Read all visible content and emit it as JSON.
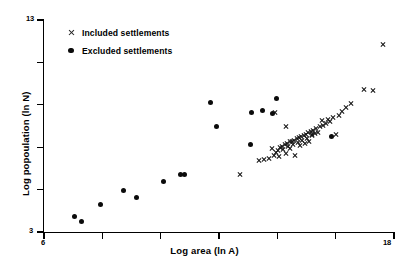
{
  "chart_data": {
    "type": "scatter",
    "title": "",
    "xlabel": "Log area (ln A)",
    "ylabel": "Log popoulation (ln N)",
    "xlim": [
      6,
      18
    ],
    "ylim": [
      3,
      13
    ],
    "xticks": [
      6,
      8,
      10,
      12,
      14,
      16,
      18
    ],
    "yticks": [
      3,
      5,
      7,
      9,
      11,
      13
    ],
    "xtick_labels": [
      "6",
      "",
      "",
      "",
      "",
      "",
      "18"
    ],
    "ytick_labels": [
      "3",
      "",
      "",
      "",
      "",
      "13"
    ],
    "x_min_label": "6",
    "x_max_label": "18",
    "y_min_label": "3",
    "y_max_label": "13",
    "grid": false,
    "legend_position": "upper-left",
    "marker_color": "#0b0b0b",
    "series": [
      {
        "name": "Included settlements",
        "marker": "x",
        "points": [
          [
            12.72,
            5.72
          ],
          [
            13.36,
            6.39
          ],
          [
            13.53,
            6.44
          ],
          [
            13.7,
            6.49
          ],
          [
            13.8,
            6.95
          ],
          [
            13.88,
            6.62
          ],
          [
            13.95,
            6.77
          ],
          [
            14.02,
            6.85
          ],
          [
            14.05,
            6.56
          ],
          [
            14.1,
            6.97
          ],
          [
            14.16,
            7.06
          ],
          [
            14.2,
            6.88
          ],
          [
            14.25,
            7.11
          ],
          [
            14.28,
            6.69
          ],
          [
            14.33,
            7.18
          ],
          [
            14.38,
            7.02
          ],
          [
            14.42,
            7.25
          ],
          [
            14.45,
            6.93
          ],
          [
            14.5,
            7.29
          ],
          [
            14.54,
            7.12
          ],
          [
            14.58,
            7.34
          ],
          [
            14.62,
            6.61
          ],
          [
            14.66,
            7.4
          ],
          [
            14.7,
            7.22
          ],
          [
            14.74,
            7.45
          ],
          [
            14.78,
            7.07
          ],
          [
            14.82,
            7.5
          ],
          [
            14.86,
            7.31
          ],
          [
            14.9,
            7.56
          ],
          [
            14.94,
            7.18
          ],
          [
            14.98,
            7.62
          ],
          [
            15.02,
            7.43
          ],
          [
            15.06,
            7.69
          ],
          [
            15.1,
            7.26
          ],
          [
            15.14,
            7.74
          ],
          [
            15.18,
            7.55
          ],
          [
            15.22,
            7.8
          ],
          [
            15.28,
            7.64
          ],
          [
            15.34,
            7.88
          ],
          [
            15.4,
            7.72
          ],
          [
            15.46,
            7.96
          ],
          [
            15.52,
            8.26
          ],
          [
            15.58,
            8.05
          ],
          [
            15.66,
            8.14
          ],
          [
            15.74,
            8.33
          ],
          [
            15.82,
            8.22
          ],
          [
            15.9,
            8.41
          ],
          [
            16.02,
            7.58
          ],
          [
            16.1,
            8.5
          ],
          [
            16.22,
            8.68
          ],
          [
            16.36,
            8.88
          ],
          [
            16.52,
            9.06
          ],
          [
            13.92,
            8.63
          ],
          [
            14.3,
            7.96
          ],
          [
            15.18,
            7.58
          ],
          [
            16.98,
            9.72
          ],
          [
            17.28,
            9.7
          ],
          [
            17.62,
            11.86
          ]
        ]
      },
      {
        "name": "Excluded settlements",
        "marker": "o",
        "points": [
          [
            7.06,
            3.72
          ],
          [
            7.3,
            3.49
          ],
          [
            7.92,
            4.3
          ],
          [
            8.74,
            4.96
          ],
          [
            9.16,
            4.65
          ],
          [
            10.1,
            5.36
          ],
          [
            10.68,
            5.7
          ],
          [
            10.8,
            5.72
          ],
          [
            11.7,
            9.09
          ],
          [
            11.92,
            7.96
          ],
          [
            13.12,
            8.63
          ],
          [
            13.48,
            8.72
          ],
          [
            13.84,
            8.61
          ],
          [
            13.98,
            9.32
          ],
          [
            13.08,
            7.12
          ],
          [
            15.86,
            7.5
          ]
        ]
      }
    ]
  },
  "legend": {
    "items": [
      {
        "label": "Included settlements",
        "marker": "x"
      },
      {
        "label": "Excluded settlements",
        "marker": "o"
      }
    ]
  }
}
